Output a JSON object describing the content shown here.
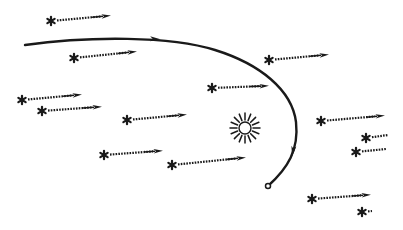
{
  "diagram": {
    "ink_color": "#1a1a1a",
    "background": "#ffffff",
    "orbit": {
      "label": "comet-orbit",
      "path": "M25,45 C90,36 170,36 215,50 C260,64 292,90 296,122 C299,150 288,168 268,186",
      "arrowheads": [
        {
          "x": 155,
          "y": 39,
          "angle": 2
        },
        {
          "x": 293,
          "y": 151,
          "angle": 100
        }
      ]
    },
    "sun": {
      "x": 245,
      "y": 128,
      "r": 6,
      "rays": 16,
      "ray_inner": 8,
      "ray_outer": 15
    },
    "comet": {
      "x": 268,
      "y": 186,
      "r": 2.5
    },
    "stars": [
      {
        "x": 51,
        "y": 21,
        "x2": 106,
        "y2": 16,
        "arrow": true
      },
      {
        "x": 74,
        "y": 58,
        "x2": 132,
        "y2": 52,
        "arrow": true
      },
      {
        "x": 22,
        "y": 100,
        "x2": 77,
        "y2": 95,
        "arrow": true
      },
      {
        "x": 42,
        "y": 111,
        "x2": 97,
        "y2": 107,
        "arrow": true
      },
      {
        "x": 127,
        "y": 120,
        "x2": 182,
        "y2": 115,
        "arrow": true
      },
      {
        "x": 212,
        "y": 88,
        "x2": 264,
        "y2": 86,
        "arrow": true
      },
      {
        "x": 269,
        "y": 60,
        "x2": 324,
        "y2": 55,
        "arrow": true
      },
      {
        "x": 104,
        "y": 155,
        "x2": 158,
        "y2": 151,
        "arrow": true
      },
      {
        "x": 172,
        "y": 165,
        "x2": 241,
        "y2": 158,
        "arrow": true
      },
      {
        "x": 321,
        "y": 121,
        "x2": 380,
        "y2": 116,
        "arrow": true
      },
      {
        "x": 366,
        "y": 138,
        "x2": 388,
        "y2": 135,
        "arrow": false
      },
      {
        "x": 356,
        "y": 152,
        "x2": 386,
        "y2": 149,
        "arrow": false
      },
      {
        "x": 312,
        "y": 199,
        "x2": 366,
        "y2": 195,
        "arrow": true
      },
      {
        "x": 362,
        "y": 212,
        "x2": 372,
        "y2": 211,
        "arrow": false
      }
    ]
  }
}
